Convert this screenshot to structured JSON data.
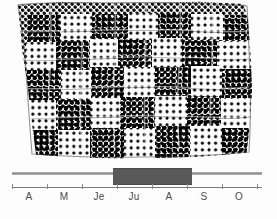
{
  "figure": {
    "title": "",
    "background_color": "#ffffff"
  },
  "map": {
    "name": "halftone-field-region",
    "description": "Dotted halftone map area subdivided into irregular cells",
    "fill_color": "#000000",
    "background_color": "#ffffff",
    "cells": [
      {
        "x": 18,
        "y": 5,
        "w": 33,
        "h": 27,
        "tone": "dark"
      },
      {
        "x": 51,
        "y": 4,
        "w": 31,
        "h": 26,
        "tone": "light"
      },
      {
        "x": 82,
        "y": 4,
        "w": 36,
        "h": 25,
        "tone": "dark"
      },
      {
        "x": 118,
        "y": 3,
        "w": 30,
        "h": 27,
        "tone": "light"
      },
      {
        "x": 148,
        "y": 3,
        "w": 33,
        "h": 25,
        "tone": "dark"
      },
      {
        "x": 181,
        "y": 4,
        "w": 32,
        "h": 26,
        "tone": "light"
      },
      {
        "x": 213,
        "y": 5,
        "w": 34,
        "h": 26,
        "tone": "dark"
      },
      {
        "x": 16,
        "y": 32,
        "w": 30,
        "h": 28,
        "tone": "light"
      },
      {
        "x": 46,
        "y": 30,
        "w": 34,
        "h": 30,
        "tone": "dark"
      },
      {
        "x": 80,
        "y": 29,
        "w": 28,
        "h": 28,
        "tone": "light"
      },
      {
        "x": 108,
        "y": 30,
        "w": 34,
        "h": 27,
        "tone": "dark"
      },
      {
        "x": 142,
        "y": 28,
        "w": 30,
        "h": 29,
        "tone": "light"
      },
      {
        "x": 172,
        "y": 29,
        "w": 35,
        "h": 27,
        "tone": "dark"
      },
      {
        "x": 207,
        "y": 31,
        "w": 40,
        "h": 28,
        "tone": "light"
      },
      {
        "x": 15,
        "y": 60,
        "w": 36,
        "h": 30,
        "tone": "dark"
      },
      {
        "x": 51,
        "y": 60,
        "w": 30,
        "h": 29,
        "tone": "light"
      },
      {
        "x": 81,
        "y": 57,
        "w": 33,
        "h": 31,
        "tone": "dark"
      },
      {
        "x": 114,
        "y": 57,
        "w": 31,
        "h": 30,
        "tone": "light"
      },
      {
        "x": 145,
        "y": 57,
        "w": 36,
        "h": 29,
        "tone": "dark"
      },
      {
        "x": 181,
        "y": 56,
        "w": 31,
        "h": 30,
        "tone": "light"
      },
      {
        "x": 212,
        "y": 59,
        "w": 36,
        "h": 29,
        "tone": "dark"
      },
      {
        "x": 14,
        "y": 90,
        "w": 32,
        "h": 30,
        "tone": "light"
      },
      {
        "x": 46,
        "y": 89,
        "w": 35,
        "h": 31,
        "tone": "dark"
      },
      {
        "x": 81,
        "y": 88,
        "w": 29,
        "h": 30,
        "tone": "light"
      },
      {
        "x": 110,
        "y": 87,
        "w": 35,
        "h": 31,
        "tone": "dark"
      },
      {
        "x": 145,
        "y": 86,
        "w": 32,
        "h": 30,
        "tone": "light"
      },
      {
        "x": 177,
        "y": 86,
        "w": 34,
        "h": 30,
        "tone": "dark"
      },
      {
        "x": 211,
        "y": 88,
        "w": 37,
        "h": 30,
        "tone": "light"
      },
      {
        "x": 14,
        "y": 120,
        "w": 34,
        "h": 28,
        "tone": "dark"
      },
      {
        "x": 48,
        "y": 120,
        "w": 32,
        "h": 29,
        "tone": "light"
      },
      {
        "x": 80,
        "y": 118,
        "w": 34,
        "h": 31,
        "tone": "dark"
      },
      {
        "x": 114,
        "y": 118,
        "w": 31,
        "h": 31,
        "tone": "light"
      },
      {
        "x": 145,
        "y": 116,
        "w": 35,
        "h": 32,
        "tone": "dark"
      },
      {
        "x": 180,
        "y": 116,
        "w": 32,
        "h": 31,
        "tone": "light"
      },
      {
        "x": 212,
        "y": 118,
        "w": 36,
        "h": 30,
        "tone": "dark"
      }
    ]
  },
  "timeline": {
    "name": "season-timeline",
    "axis": {
      "start_px": 12,
      "end_px": 262,
      "ticks": [
        12,
        47,
        82,
        117,
        152,
        187,
        222,
        257
      ],
      "labels": [
        {
          "text": "A",
          "center_px": 29
        },
        {
          "text": "M",
          "center_px": 64
        },
        {
          "text": "Je",
          "center_px": 99
        },
        {
          "text": "Ju",
          "center_px": 134
        },
        {
          "text": "A",
          "center_px": 169
        },
        {
          "text": "S",
          "center_px": 204
        },
        {
          "text": "O",
          "center_px": 239
        }
      ]
    },
    "period_bar": {
      "label": "",
      "start_px": 113,
      "end_px": 192,
      "color": "#595959",
      "start_label": "Ju",
      "end_label": "A"
    },
    "track_color": "#9a9a9a"
  },
  "chart_data": {
    "type": "bar",
    "title": "",
    "xlabel": "",
    "ylabel": "",
    "categories": [
      "A",
      "M",
      "Je",
      "Ju",
      "A",
      "S",
      "O"
    ],
    "values": [
      0,
      0,
      0,
      1,
      1,
      0,
      0
    ],
    "annotations": [
      {
        "text": "activity period",
        "from": "Ju",
        "to": "A"
      }
    ],
    "grid": false,
    "legend": "none"
  }
}
